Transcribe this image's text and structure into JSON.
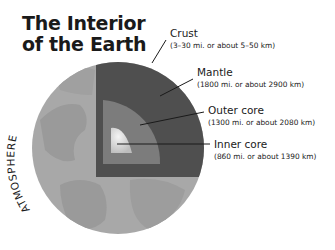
{
  "title": {
    "line1": "The Interior",
    "line2": "of the Earth"
  },
  "side_label": "ATMOSPHERE",
  "layers": [
    {
      "name": "Crust",
      "detail": "(3–30 mi. or about 5–50 km)"
    },
    {
      "name": "Mantle",
      "detail": "(1800 mi. or about 2900 km)"
    },
    {
      "name": "Outer core",
      "detail": "(1300 mi. or about 2080 km)"
    },
    {
      "name": "Inner core",
      "detail": "(860 mi. or about 1390 km)"
    }
  ],
  "colors": {
    "globe": "#a6a6a6",
    "continents": "#979797",
    "crust_mantle": "#4d4d4d",
    "outer_core": "#7c7c7c",
    "inner_core": "#e0e0e0"
  }
}
